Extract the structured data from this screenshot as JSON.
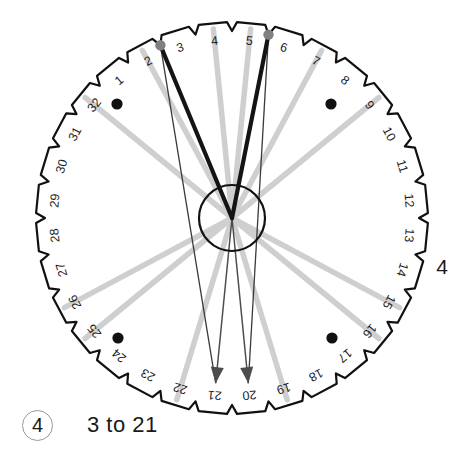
{
  "figure": {
    "type": "numbered-dial-wheel",
    "total_positions": 32,
    "position_labels": [
      "1",
      "2",
      "3",
      "4",
      "5",
      "6",
      "7",
      "8",
      "9",
      "10",
      "11",
      "12",
      "13",
      "14",
      "15",
      "16",
      "17",
      "18",
      "19",
      "20",
      "21",
      "22",
      "23",
      "24",
      "25",
      "26",
      "27",
      "28",
      "29",
      "30",
      "31",
      "32"
    ],
    "center": {
      "x": 232,
      "y": 218
    },
    "outer_radius": 196,
    "hub_radius": 33,
    "colors": {
      "outline": "#111111",
      "dark_line": "#141414",
      "thin_line": "#3a3a3a",
      "light_line": "#cfcfcf",
      "marker_dot": "#111111",
      "node_dot": "#808080",
      "arrow": "#4d4d4d",
      "badge_ring": "#9a9a9a"
    },
    "thick_lines": [
      {
        "name": "thick-spoke-3",
        "position": 3
      },
      {
        "name": "thick-spoke-6",
        "position": 6
      }
    ],
    "node_dots": [
      {
        "name": "node-dot-3",
        "position": 3
      },
      {
        "name": "node-dot-6",
        "position": 6
      }
    ],
    "light_lines": [
      {
        "name": "light-spoke-2",
        "position": 2
      },
      {
        "name": "light-spoke-4",
        "position": 4
      },
      {
        "name": "light-spoke-5",
        "position": 5
      },
      {
        "name": "light-spoke-7",
        "position": 7
      },
      {
        "name": "light-spoke-9",
        "position": 9
      },
      {
        "name": "light-spoke-15",
        "position": 15
      },
      {
        "name": "light-spoke-16",
        "position": 16
      },
      {
        "name": "light-spoke-19",
        "position": 19
      },
      {
        "name": "light-spoke-22",
        "position": 22
      },
      {
        "name": "light-spoke-25",
        "position": 25
      },
      {
        "name": "light-spoke-26",
        "position": 26
      },
      {
        "name": "light-spoke-32",
        "position": 32
      }
    ],
    "arrows": [
      {
        "name": "arrow-to-21",
        "position": 21,
        "label": "21"
      },
      {
        "name": "arrow-to-20",
        "position": 20,
        "label": "20"
      }
    ],
    "marker_dots": [
      {
        "name": "marker-dot-top-left",
        "x": 117,
        "y": 104
      },
      {
        "name": "marker-dot-top-right",
        "x": 331,
        "y": 104
      },
      {
        "name": "marker-dot-bottom-left",
        "x": 118,
        "y": 338
      },
      {
        "name": "marker-dot-bottom-right",
        "x": 332,
        "y": 338
      }
    ]
  },
  "caption": {
    "badge": "4",
    "text": "3 to 21"
  },
  "side_label": "4"
}
